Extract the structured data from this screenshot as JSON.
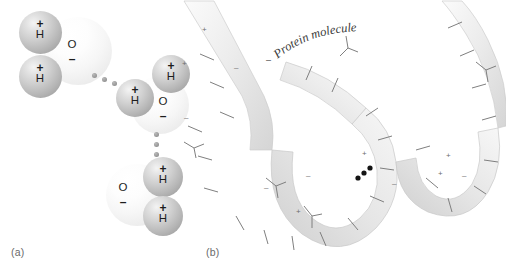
{
  "figure": {
    "panels": [
      {
        "id": "a",
        "label": "(a)",
        "caption_subject": "water molecules hydrogen bonded"
      },
      {
        "id": "b",
        "label": "(b)",
        "caption_subject": "protein molecule with hydrogen bond"
      }
    ]
  },
  "colors": {
    "background": "#ffffff",
    "hydrogen_sphere": "#b6b6b6",
    "oxygen_sphere": "#f2f2f2",
    "atom_text": "#1d1d1d",
    "bond_dot": "#9c9c9c",
    "protein_ribbon": "#e9e9e9",
    "protein_ribbon_edge": "#c8c8c8",
    "side_chain": "#7a7a7a",
    "protein_bond_dot": "#1a1a1a",
    "panel_label": "#6a6a6a"
  },
  "panel_a": {
    "molecules": [
      {
        "name": "water-molecule-1",
        "atoms": [
          {
            "symbol": "H",
            "charge": "+"
          },
          {
            "symbol": "H",
            "charge": "+"
          },
          {
            "symbol": "O",
            "charge": "–"
          }
        ]
      },
      {
        "name": "water-molecule-2",
        "atoms": [
          {
            "symbol": "H",
            "charge": "+"
          },
          {
            "symbol": "H",
            "charge": "+"
          },
          {
            "symbol": "O",
            "charge": "–"
          }
        ]
      },
      {
        "name": "water-molecule-3",
        "atoms": [
          {
            "symbol": "H",
            "charge": "+"
          },
          {
            "symbol": "H",
            "charge": "+"
          },
          {
            "symbol": "O",
            "charge": "–"
          }
        ]
      }
    ],
    "hydrogen_bonds": [
      {
        "name": "hydrogen-bond-1-2",
        "dot_count": 3
      },
      {
        "name": "hydrogen-bond-2-3",
        "dot_count": 3
      }
    ]
  },
  "panel_b": {
    "label": "Protein molecule",
    "charge_markers": [
      "+",
      "–",
      "+",
      "–",
      "+",
      "–",
      "+",
      "–"
    ],
    "hydrogen_bond": {
      "name": "protein-hydrogen-bond",
      "dot_count": 3
    }
  }
}
